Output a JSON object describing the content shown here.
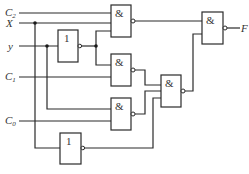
{
  "diagram": {
    "type": "logic-circuit",
    "inputs": [
      {
        "id": "C2",
        "label": "C",
        "sub": "2",
        "y": 13
      },
      {
        "id": "X",
        "label": "X",
        "sub": "",
        "y": 23
      },
      {
        "id": "Y",
        "label": "y",
        "sub": "",
        "y": 46
      },
      {
        "id": "C1",
        "label": "C",
        "sub": "1",
        "y": 77
      },
      {
        "id": "C0",
        "label": "C",
        "sub": "0",
        "y": 121
      }
    ],
    "output": {
      "id": "F",
      "label": "F"
    },
    "gates": [
      {
        "id": "not1",
        "type": "NOT",
        "symbol": "1",
        "inputs": [
          "Y"
        ]
      },
      {
        "id": "nand1",
        "type": "NAND",
        "symbol": "&",
        "inputs": [
          "C2",
          "X",
          "not1"
        ]
      },
      {
        "id": "nand2",
        "type": "NAND",
        "symbol": "&",
        "inputs": [
          "not1",
          "C1"
        ]
      },
      {
        "id": "nand3",
        "type": "NAND",
        "symbol": "&",
        "inputs": [
          "Y",
          "C0"
        ]
      },
      {
        "id": "not2",
        "type": "NOT",
        "symbol": "1",
        "inputs": [
          "X"
        ]
      },
      {
        "id": "nand4",
        "type": "NAND",
        "symbol": "&",
        "inputs": [
          "nand2",
          "nand3",
          "not2"
        ]
      },
      {
        "id": "nand5",
        "type": "NAND",
        "symbol": "&",
        "inputs": [
          "nand1",
          "nand4"
        ]
      }
    ],
    "symbols": {
      "and": "&",
      "not": "1"
    }
  }
}
